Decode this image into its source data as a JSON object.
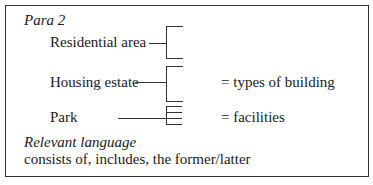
{
  "heading": "Para 2",
  "items": [
    {
      "label": "Residential area",
      "meaning": ""
    },
    {
      "label": "Housing estate",
      "meaning": "= types of building"
    },
    {
      "label": "Park",
      "meaning": "= facilities"
    }
  ],
  "relevant_language": {
    "title": "Relevant language",
    "text": "consists of, includes, the former/latter"
  }
}
